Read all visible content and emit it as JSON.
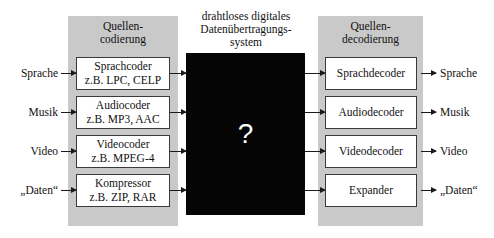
{
  "diagram": {
    "center_heading": "drahtloses digitales\nDatenübertragungs-\nsystem",
    "blackbox_symbol": "?",
    "panel_fill_color": "#c9c9c9",
    "blackbox_color": "#050505",
    "box_border_color": "#3a3a3a"
  },
  "left_panel": {
    "title": "Quellen-\ncodierung",
    "boxes": [
      {
        "label": "Sprachcoder\nz.B. LPC, CELP"
      },
      {
        "label": "Audiocoder\nz.B. MP3, AAC"
      },
      {
        "label": "Videocoder\nz.B. MPEG-4"
      },
      {
        "label": "Kompressor\nz.B. ZIP, RAR"
      }
    ]
  },
  "right_panel": {
    "title": "Quellen-\ndecodierung",
    "boxes": [
      {
        "label": "Sprachdecoder"
      },
      {
        "label": "Audiodecoder"
      },
      {
        "label": "Videodecoder"
      },
      {
        "label": "Expander"
      }
    ]
  },
  "inputs": [
    {
      "label": "Sprache"
    },
    {
      "label": "Musik"
    },
    {
      "label": "Video"
    },
    {
      "label": "„Daten“"
    }
  ],
  "outputs": [
    {
      "label": "Sprache"
    },
    {
      "label": "Musik"
    },
    {
      "label": "Video"
    },
    {
      "label": "„Daten“"
    }
  ]
}
